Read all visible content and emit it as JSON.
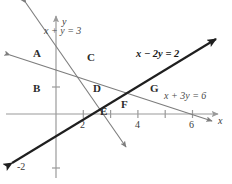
{
  "figure": {
    "type": "line-graph-regions",
    "width": 232,
    "height": 184,
    "background": "#ffffff"
  },
  "axes": {
    "x_axis_label": "x",
    "y_axis_label": "y",
    "origin_px": [
      56,
      114
    ],
    "units_per_px_x": 27.3,
    "units_per_px_y": 27.0,
    "x_ticks": [
      1,
      2,
      3,
      4,
      5,
      6
    ],
    "x_tick_labels": [
      {
        "value": 2,
        "text": "2"
      },
      {
        "value": 4,
        "text": "4"
      },
      {
        "value": 6,
        "text": "6"
      }
    ],
    "y_ticks": [
      -2,
      1
    ],
    "y_tick_labels": [
      {
        "value": -2,
        "text": "-2"
      }
    ],
    "axis_color": "#9a9a9a"
  },
  "lines": [
    {
      "id": "line-x-plus-y-3",
      "label": "x + y = 3",
      "equation": "x + y = 3",
      "slope": -1,
      "intercept": 3,
      "color": "#7d7d7d",
      "width": 1.1,
      "bold": false,
      "arrows": "both",
      "label_pos_px": [
        44,
        30
      ]
    },
    {
      "id": "line-x-minus-2y-2",
      "label": "x - 2y = 2",
      "equation": "x − 2y = 2",
      "slope": 0.5,
      "intercept": -1,
      "color": "#1f1f1f",
      "width": 2.1,
      "bold": true,
      "arrows": "both",
      "label_pos_px": [
        136,
        52
      ]
    },
    {
      "id": "line-x-plus-3y-6",
      "label": "x + 3y = 6",
      "equation": "x + 3y = 6",
      "slope": -0.3333,
      "intercept": 2,
      "color": "#7d7d7d",
      "width": 1.1,
      "arrows": "both",
      "label_pos_px": [
        166,
        94
      ]
    }
  ],
  "regions": [
    {
      "id": "A",
      "label": "A",
      "pos_px": [
        35,
        53
      ]
    },
    {
      "id": "B",
      "label": "B",
      "pos_px": [
        35,
        88
      ]
    },
    {
      "id": "C",
      "label": "C",
      "pos_px": [
        89,
        57
      ]
    },
    {
      "id": "D",
      "label": "D",
      "pos_px": [
        95,
        88
      ]
    },
    {
      "id": "E",
      "label": "E",
      "pos_px": [
        101,
        111
      ]
    },
    {
      "id": "F",
      "label": "F",
      "pos_px": [
        123,
        104
      ]
    },
    {
      "id": "G",
      "label": "G",
      "pos_px": [
        152,
        88
      ]
    }
  ]
}
